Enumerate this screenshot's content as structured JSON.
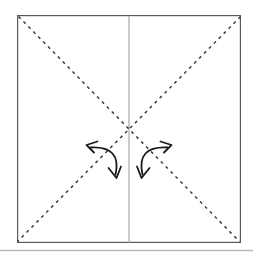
{
  "figure": {
    "kind": "origami-fold-diagram",
    "background_color": "#ffffff",
    "square": {
      "name": "paper-square",
      "x": 17,
      "y": 15,
      "width": 224,
      "height": 228,
      "stroke_color": "#5a5a5a",
      "stroke_width": 1.2,
      "fill_color": "#ffffff"
    },
    "center_line": {
      "name": "vertical-center-line",
      "x": 129,
      "y1": 15,
      "y2": 243,
      "stroke_color": "#b4b4b4",
      "stroke_width": 1.4,
      "style": "solid"
    },
    "diagonals": [
      {
        "name": "diagonal-fold-line-top-left-to-bottom-right",
        "x1": 18,
        "y1": 16,
        "x2": 240,
        "y2": 242,
        "stroke_color": "#3b3b3b",
        "stroke_width": 1.5,
        "style": "dashed",
        "dash_length": 3,
        "gap_length": 4
      },
      {
        "name": "diagonal-fold-line-top-right-to-bottom-left",
        "x1": 240,
        "y1": 16,
        "x2": 18,
        "y2": 242,
        "stroke_color": "#3b3b3b",
        "stroke_width": 1.5,
        "style": "dashed",
        "dash_length": 3,
        "gap_length": 4
      }
    ],
    "arrows": [
      {
        "name": "fold-arrow-left",
        "type": "double-headed-curved-arrow",
        "stroke_color": "#1a1a1a",
        "stroke_width": 1.8,
        "start_x": 88,
        "start_y": 145,
        "end_x": 117,
        "end_y": 177,
        "control_x": 122,
        "control_y": 146,
        "head_start": "upper-left",
        "head_end": "lower-right"
      },
      {
        "name": "fold-arrow-right",
        "type": "double-headed-curved-arrow",
        "stroke_color": "#1a1a1a",
        "stroke_width": 1.8,
        "start_x": 170,
        "start_y": 145,
        "end_x": 141,
        "end_y": 177,
        "control_x": 136,
        "control_y": 146,
        "head_start": "upper-right",
        "head_end": "lower-left"
      }
    ],
    "bottom_rule": {
      "name": "page-divider-rule",
      "x1": 0,
      "y1": 250,
      "x2": 253,
      "y2": 250,
      "stroke_color": "#b9b9b9",
      "stroke_width": 1.3
    }
  }
}
